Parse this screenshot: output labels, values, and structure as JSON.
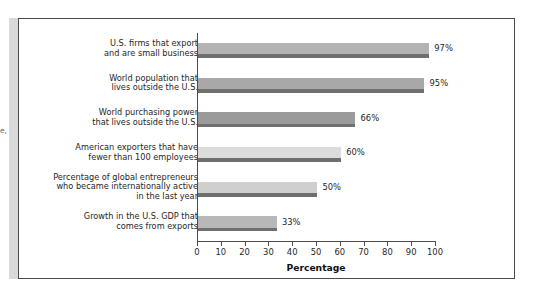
{
  "page": {
    "margin_artifact_text": "e,"
  },
  "chart_data": {
    "type": "bar",
    "orientation": "horizontal",
    "title": "",
    "subtitle": "",
    "xlabel": "Percentage",
    "ylabel": "",
    "xlim": [
      0,
      100
    ],
    "xticks": [
      0,
      10,
      20,
      30,
      40,
      50,
      60,
      70,
      80,
      90,
      100
    ],
    "xtick_labels": [
      "0",
      "10",
      "20",
      "30",
      "40",
      "50",
      "60",
      "70",
      "80",
      "90",
      "100"
    ],
    "grid": false,
    "legend": "none",
    "categories": [
      "U.S. firms that export\nand are small business",
      "World population that\nlives outside the U.S.",
      "World purchasing power\nthat lives outside the U.S.",
      "American exporters that have\nfewer than 100 employees",
      "Percentage of global entrepreneurs\nwho became internationally active\nin the last year",
      "Growth in the U.S. GDP that\ncomes from exports"
    ],
    "values": [
      97,
      95,
      66,
      60,
      50,
      33
    ],
    "value_labels": [
      "97%",
      "95%",
      "66%",
      "60%",
      "50%",
      "33%"
    ],
    "bar_colors": [
      "#b3b3b3",
      "#a8a8a8",
      "#9a9a9a",
      "#dcdcdc",
      "#cfcfcf",
      "#b8b8b8"
    ],
    "bar_shadow_color": "#6f6f6f",
    "axis_color": "#4d4d4d",
    "frame_color": "#4a4a4a",
    "background_color": "#ffffff"
  }
}
